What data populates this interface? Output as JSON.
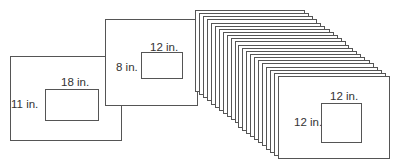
{
  "diagram": {
    "line_color": "#555555",
    "text_color": "#333333",
    "frames": [
      {
        "name": "frame-18x11",
        "box": {
          "x": 10,
          "y": 56,
          "w": 112,
          "h": 85
        },
        "inner": {
          "x": 45,
          "y": 89,
          "w": 54,
          "h": 32
        },
        "width_label": "18 in.",
        "height_label": "11 in.",
        "width_label_pos": {
          "x": 61,
          "y": 76
        },
        "height_label_pos": {
          "x": 11,
          "y": 98
        }
      },
      {
        "name": "frame-12x8",
        "box": {
          "x": 105,
          "y": 19,
          "w": 93,
          "h": 87
        },
        "inner": {
          "x": 141,
          "y": 52,
          "w": 42,
          "h": 27
        },
        "width_label": "12 in.",
        "height_label": "8 in.",
        "width_label_pos": {
          "x": 150,
          "y": 41
        },
        "height_label_pos": {
          "x": 116,
          "y": 61
        }
      }
    ],
    "stack": {
      "count": 22,
      "back": {
        "x": 195,
        "y": 10,
        "w": 110,
        "h": 82
      },
      "front": {
        "x": 278,
        "y": 76,
        "w": 112,
        "h": 83
      },
      "front_inner": {
        "x": 321,
        "y": 103,
        "w": 41,
        "h": 40
      },
      "width_label": "12 in.",
      "height_label": "12 in.",
      "width_label_pos": {
        "x": 330,
        "y": 90
      },
      "height_label_pos": {
        "x": 294,
        "y": 116
      }
    }
  }
}
